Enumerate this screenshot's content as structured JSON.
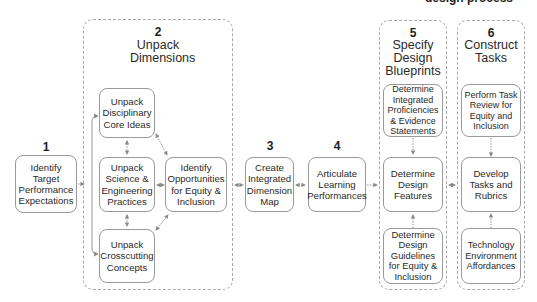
{
  "diagram": {
    "title_fragment": "design process",
    "steps": [
      {
        "number": "1",
        "boxes": [
          {
            "label": "Identify Target Performance Expectations"
          }
        ]
      },
      {
        "number": "2",
        "title": "Unpack Dimensions",
        "boxes": [
          {
            "label": "Unpack Disciplinary Core Ideas"
          },
          {
            "label": "Unpack Science & Engineering Practices"
          },
          {
            "label": "Unpack Crosscutting Concepts"
          },
          {
            "label": "Identify Opportunities for Equity & Inclusion"
          }
        ]
      },
      {
        "number": "3",
        "boxes": [
          {
            "label": "Create Integrated Dimension Map"
          }
        ]
      },
      {
        "number": "4",
        "boxes": [
          {
            "label": "Articulate Learning Performances"
          }
        ]
      },
      {
        "number": "5",
        "title": "Specify Design Blueprints",
        "boxes": [
          {
            "label": "Determine Integrated Proficiencies & Evidence Statements"
          },
          {
            "label": "Determine Design Features"
          },
          {
            "label": "Determine Design Guidelines for Equity & Inclusion"
          }
        ]
      },
      {
        "number": "6",
        "title": "Construct Tasks",
        "boxes": [
          {
            "label": "Perform Task Review for Equity and Inclusion"
          },
          {
            "label": "Develop Tasks and Rubrics"
          },
          {
            "label": "Technology Environment Affordances"
          }
        ]
      }
    ],
    "colors": {
      "box_border": "#9a9a9a",
      "group_border": "#a8a8a8",
      "arrow": "#8a8a8a",
      "text": "#2a2a2a"
    }
  }
}
